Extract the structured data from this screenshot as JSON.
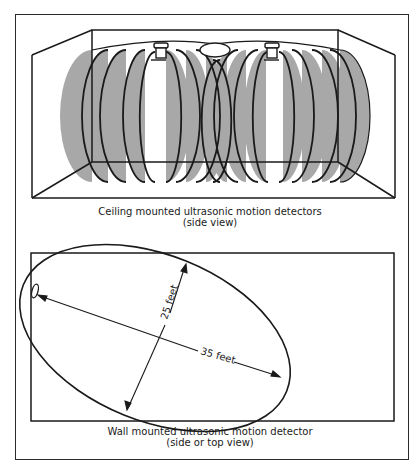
{
  "figure": {
    "panels": [
      {
        "id": "ceiling",
        "caption_line1": "Ceiling mounted ultrasonic motion detectors",
        "caption_line2": "(side view)",
        "detector_count": 2,
        "pattern_fill": "#a8a8a8"
      },
      {
        "id": "wall",
        "caption_line1": "Wall mounted ultrasonic motion detector",
        "caption_line2": "(side or top view)",
        "dimensions": {
          "width_label": "25 feet",
          "length_label": "35 feet"
        }
      }
    ],
    "colors": {
      "line": "#1a1a1a",
      "shade": "#a8a8a8",
      "background": "#ffffff"
    }
  }
}
